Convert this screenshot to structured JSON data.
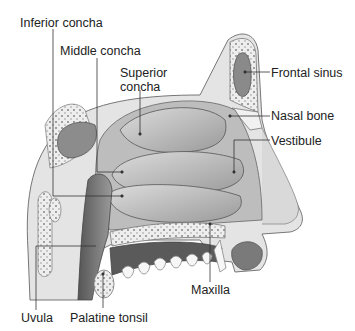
{
  "labels": {
    "inferior_concha": "Inferior concha",
    "middle_concha": "Middle concha",
    "superior_concha_1": "Superior",
    "superior_concha_2": "concha",
    "frontal_sinus": "Frontal sinus",
    "nasal_bone": "Nasal bone",
    "vestibule": "Vestibule",
    "maxilla": "Maxilla",
    "uvula": "Uvula",
    "palatine_tonsil": "Palatine tonsil"
  },
  "colors": {
    "tissue_light": "#e6e6e6",
    "tissue_mid": "#b5b5b5",
    "tissue_dark": "#6a6a6a",
    "leader_line": "#333333"
  }
}
